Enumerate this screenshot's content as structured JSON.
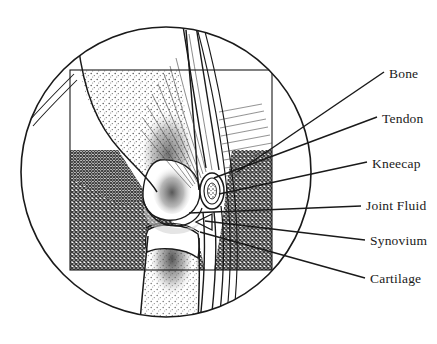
{
  "figure": {
    "frame_shape": "circle",
    "inset_shape": "rectangle",
    "stroke_color": "#1a1a1a",
    "background_color": "#ffffff",
    "bone_fill": "#ffffff",
    "muscle_tone": "#6e6e6e",
    "marrow_tone": "#8a8a8a"
  },
  "labels": [
    {
      "id": "bone",
      "text": "Bone",
      "text_x": 389,
      "text_y": 77,
      "leader": {
        "x1": 384,
        "y1": 72,
        "x2": 237,
        "y2": 172
      }
    },
    {
      "id": "tendon",
      "text": "Tendon",
      "text_x": 382,
      "text_y": 122,
      "leader": {
        "x1": 377,
        "y1": 117,
        "x2": 214,
        "y2": 178
      }
    },
    {
      "id": "kneecap",
      "text": "Kneecap",
      "text_x": 372,
      "text_y": 167,
      "leader": {
        "x1": 367,
        "y1": 162,
        "x2": 219,
        "y2": 194
      }
    },
    {
      "id": "joint-fluid",
      "text": "Joint Fluid",
      "text_x": 366,
      "text_y": 209,
      "leader": {
        "x1": 361,
        "y1": 206,
        "x2": 189,
        "y2": 213
      }
    },
    {
      "id": "synovium",
      "text": "Synovium",
      "text_x": 370,
      "text_y": 244,
      "leader": {
        "x1": 365,
        "y1": 240,
        "x2": 205,
        "y2": 221
      }
    },
    {
      "id": "cartilage",
      "text": "Cartilage",
      "text_x": 370,
      "text_y": 282,
      "leader": {
        "x1": 365,
        "y1": 278,
        "x2": 200,
        "y2": 232
      }
    }
  ],
  "anatomy": {
    "parts": [
      "femur",
      "tibia",
      "patella",
      "quadriceps-tendon",
      "patellar-tendon",
      "joint-space",
      "synovium",
      "cartilage",
      "hamstring-muscle",
      "calf-muscle"
    ]
  }
}
